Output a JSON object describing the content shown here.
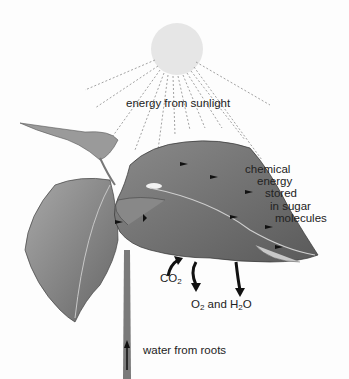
{
  "diagram": {
    "type": "photosynthesis-illustration",
    "colors": {
      "sun": "#e8e8e8",
      "leaf_dark": "#6a6a6a",
      "leaf_mid": "#9a9a9a",
      "leaf_light": "#c4c4c4",
      "arrow": "#111111",
      "ray": "#888888"
    },
    "labels": {
      "sunlight": "energy from sunlight",
      "chemical_line1": "chemical",
      "chemical_line2": "energy",
      "chemical_line3": "stored",
      "chemical_line4": "in sugar",
      "chemical_line5": "molecules",
      "co2_base": "CO",
      "co2_sub": "2",
      "o2_base": "O",
      "o2_sub": "2",
      "and": " and H",
      "h2o_sub": "2",
      "h2o_tail": "O",
      "water": "water from roots"
    }
  }
}
